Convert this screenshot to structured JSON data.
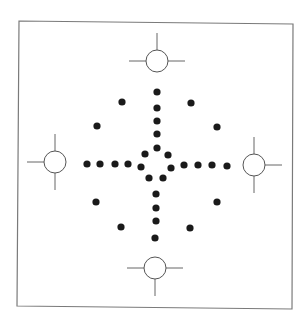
{
  "figure": {
    "colors": {
      "background": "#ffffff",
      "frame": "#7a7a7a",
      "dot": "#1a1a1a",
      "target_stroke": "#555555"
    },
    "targets": [
      {
        "name": "top",
        "ticks": [
          "up",
          "left",
          "right"
        ]
      },
      {
        "name": "left",
        "ticks": [
          "up",
          "down",
          "left"
        ]
      },
      {
        "name": "right",
        "ticks": [
          "up",
          "down",
          "right"
        ]
      },
      {
        "name": "bottom",
        "ticks": [
          "down",
          "left",
          "right"
        ]
      }
    ],
    "dot_groups": {
      "vertical_top": 4,
      "vertical_bottom": 4,
      "horizontal_left": 4,
      "horizontal_right": 4,
      "center_ring": 7,
      "diagonal_upper_left": 2,
      "diagonal_upper_right": 2,
      "diagonal_lower_left": 2,
      "diagonal_lower_right": 2
    },
    "total_dots": 31
  }
}
